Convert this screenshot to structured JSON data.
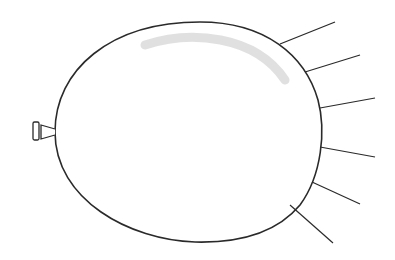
{
  "figure": {
    "title": "Balloon with radiating lines",
    "colors": {
      "background": "#ffffff",
      "stroke": "#2a2a2a",
      "highlight": "#d8d8d8"
    },
    "balloon": {
      "outline_path": "M 55 132 C 55 70, 110 22, 200 22 C 265 22, 305 55, 318 100 C 326 130, 322 175, 300 205 C 275 235, 235 243, 195 242 C 130 240, 55 200, 55 132 Z",
      "highlight_path": "M 145 45 C 190 30, 255 35, 285 80",
      "nozzle": {
        "neck_path": "M 55 129 L 41 125 L 41 139 L 55 135",
        "ring": {
          "x": 33,
          "y": 122,
          "width": 6,
          "height": 18
        }
      }
    },
    "rays": [
      {
        "x1": 280,
        "y1": 44,
        "x2": 335,
        "y2": 22
      },
      {
        "x1": 305,
        "y1": 72,
        "x2": 360,
        "y2": 55
      },
      {
        "x1": 320,
        "y1": 108,
        "x2": 375,
        "y2": 98
      },
      {
        "x1": 320,
        "y1": 147,
        "x2": 375,
        "y2": 157
      },
      {
        "x1": 312,
        "y1": 182,
        "x2": 360,
        "y2": 204
      },
      {
        "x1": 290,
        "y1": 205,
        "x2": 333,
        "y2": 243
      }
    ]
  }
}
